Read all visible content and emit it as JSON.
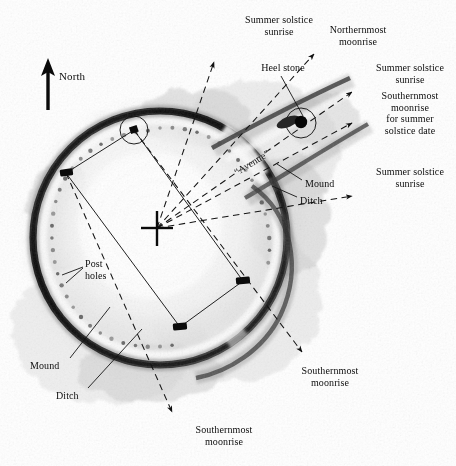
{
  "figure": {
    "kind": "archaeological-plan-diagram",
    "background_color": "#ffffff",
    "ink_color": "#111111"
  },
  "compass": {
    "label": "North",
    "direction": "up",
    "icon": "north-arrow-icon"
  },
  "avenue": {
    "label": "“Avenue”"
  },
  "alignment_labels": [
    {
      "id": "ssr-nw",
      "text": "Summer solstice\nsunrise",
      "x": 224,
      "y": 14,
      "width": 110,
      "align": "center"
    },
    {
      "id": "north-moon",
      "text": "Northernmost\nmoonrise",
      "x": 308,
      "y": 24,
      "width": 100,
      "align": "center"
    },
    {
      "id": "ssr-ne",
      "text": "Summer solstice\nsunrise",
      "x": 364,
      "y": 62,
      "width": 92,
      "align": "center"
    },
    {
      "id": "south-moon-ss",
      "text": "Southernmost\nmoonrise\nfor summer\nsolstice date",
      "x": 364,
      "y": 90,
      "width": 92,
      "align": "center"
    },
    {
      "id": "ssr-e",
      "text": "Summer solstice\nsunrise",
      "x": 364,
      "y": 166,
      "width": 92,
      "align": "center"
    },
    {
      "id": "south-moon-se",
      "text": "Southernmost\nmoonrise",
      "x": 282,
      "y": 365,
      "width": 96,
      "align": "center"
    },
    {
      "id": "south-moon-s",
      "text": "Southernmost\nmoonrise",
      "x": 176,
      "y": 424,
      "width": 96,
      "align": "center"
    }
  ],
  "feature_labels": [
    {
      "id": "heel-stone",
      "text": "Heel stone",
      "x": 248,
      "y": 62,
      "width": 70,
      "align": "center"
    },
    {
      "id": "mound-right",
      "text": "Mound",
      "x": 305,
      "y": 178,
      "width": 44,
      "align": "left"
    },
    {
      "id": "ditch-right",
      "text": "Ditch",
      "x": 300,
      "y": 195,
      "width": 40,
      "align": "left"
    },
    {
      "id": "post-holes",
      "text": "Post\nholes",
      "x": 85,
      "y": 258,
      "width": 40,
      "align": "left"
    },
    {
      "id": "mound-left",
      "text": "Mound",
      "x": 30,
      "y": 360,
      "width": 46,
      "align": "left"
    },
    {
      "id": "ditch-left",
      "text": "Ditch",
      "x": 56,
      "y": 390,
      "width": 40,
      "align": "left"
    }
  ],
  "markers": {
    "center_marker": {
      "name": "observation-center-cross",
      "x": 157,
      "y": 228
    },
    "heel_stone": {
      "name": "heel-stone-marker",
      "x": 301,
      "y": 123
    },
    "station_stones": [
      {
        "name": "station-stone-north-west",
        "x": 134,
        "y": 130,
        "circled": true
      },
      {
        "name": "station-stone-west",
        "x": 66,
        "y": 173,
        "circled": false
      },
      {
        "name": "station-stone-south",
        "x": 180,
        "y": 327,
        "circled": false
      },
      {
        "name": "station-stone-east",
        "x": 243,
        "y": 281,
        "circled": false
      }
    ]
  },
  "sight_lines": [
    {
      "name": "sightline-summer-solstice-sunrise-nw",
      "target": "Summer solstice sunrise",
      "from": [
        157,
        228
      ],
      "to": [
        214,
        62
      ]
    },
    {
      "name": "sightline-northernmost-moonrise",
      "target": "Northernmost moonrise",
      "from": [
        157,
        228
      ],
      "to": [
        314,
        55
      ]
    },
    {
      "name": "sightline-summer-solstice-sunrise-ne",
      "target": "Summer solstice sunrise",
      "from": [
        157,
        228
      ],
      "to": [
        352,
        92
      ]
    },
    {
      "name": "sightline-southernmost-moonrise-ss",
      "target": "Southernmost moonrise for summer solstice date",
      "from": [
        157,
        228
      ],
      "to": [
        352,
        122
      ]
    },
    {
      "name": "sightline-summer-solstice-sunrise-e",
      "target": "Summer solstice sunrise",
      "from": [
        157,
        228
      ],
      "to": [
        352,
        196
      ]
    },
    {
      "name": "sightline-southernmost-moonrise-se",
      "target": "Southernmost moonrise",
      "from": [
        134,
        130
      ],
      "to": [
        302,
        352
      ]
    },
    {
      "name": "sightline-southernmost-moonrise-s",
      "target": "Southernmost moonrise",
      "from": [
        66,
        173
      ],
      "to": [
        172,
        412
      ]
    }
  ]
}
